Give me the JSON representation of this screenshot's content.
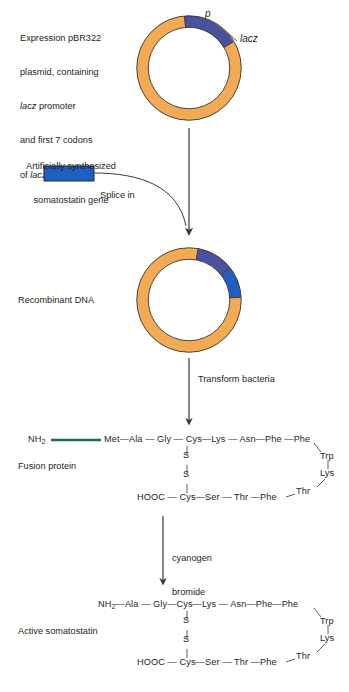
{
  "figure": {
    "background": "#ffffff",
    "colors": {
      "plasmid_backbone": "#f2ab54",
      "plasmid_outline": "#3b3730",
      "lacz_arc": "#4a52a0",
      "somatostatin_arc": "#1f5fc0",
      "gene_rect": "#1f5fc0",
      "gene_rect_outline": "#2a2a2a",
      "nh2_link": "#1d6b5e",
      "text": "#231f20",
      "arrow": "#3a3a3a"
    }
  },
  "steps": {
    "plasmid_caption": {
      "line1": "Expression pBR322",
      "line2": "plasmid, containing",
      "line3_italic": "lacz",
      "line3_rest": " promoter",
      "line4": "and first 7 codons",
      "line5_rest": "of ",
      "line5_italic": "lacz",
      "line5_tail": " gene"
    },
    "plasmid_labels": {
      "promoter": "p",
      "gene": "lacz"
    },
    "gene_caption": {
      "line1": "Artificially synthesized",
      "line2": "somatostatin gene"
    },
    "splice_label": "Splice in",
    "recombinant_label": "Recombinant DNA",
    "transform_label": "Transform bacteria",
    "fusion_label": "Fusion protein",
    "cleavage_label": {
      "line1": "cyanogen",
      "line2": "bromide"
    },
    "active_label": "Active somatostatin"
  },
  "fusion_protein": {
    "n_terminus": "NH",
    "n_terminus_sub": "2",
    "top_chain": [
      "Met",
      "Ala",
      "Gly",
      "Cys",
      "Lys",
      "Asn",
      "Phe",
      "Phe"
    ],
    "right_loop": [
      "Trp",
      "Lys",
      "Thr"
    ],
    "bottom_chain_start": "HOOC",
    "bottom_chain": [
      "Cys",
      "Ser",
      "Thr",
      "Phe"
    ],
    "disulfide": [
      "S",
      "S"
    ]
  },
  "active_somatostatin": {
    "n_terminus": "NH",
    "n_terminus_sub": "2",
    "top_chain": [
      "Ala",
      "Gly",
      "Cys",
      "Lys",
      "Asn",
      "Phe",
      "Phe"
    ],
    "right_loop": [
      "Trp",
      "Lys",
      "Thr"
    ],
    "bottom_chain_start": "HOOC",
    "bottom_chain": [
      "Cys",
      "Ser",
      "Thr",
      "Phe"
    ],
    "disulfide": [
      "S",
      "S"
    ]
  }
}
